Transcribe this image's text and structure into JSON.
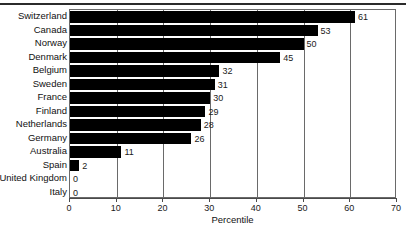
{
  "chart_data": {
    "type": "bar",
    "orientation": "horizontal",
    "title": "",
    "xlabel": "Percentile",
    "ylabel": "",
    "xlim": [
      0,
      70
    ],
    "xticks": [
      0,
      10,
      20,
      30,
      40,
      50,
      60,
      70
    ],
    "grid": true,
    "legend": null,
    "bar_color": "#000000",
    "frame_color": "#6a6a6a",
    "categories": [
      "Switzerland",
      "Canada",
      "Norway",
      "Denmark",
      "Belgium",
      "Sweden",
      "France",
      "Finland",
      "Netherlands",
      "Germany",
      "Australia",
      "United Kingdom",
      "Italy"
    ],
    "values": [
      61,
      53,
      50,
      45,
      32,
      31,
      30,
      29,
      28,
      26,
      11,
      2,
      0
    ],
    "data_labels": [
      "61",
      "53",
      "50",
      "45",
      "32",
      "31",
      "30",
      "29",
      "28",
      "26",
      "11",
      "2",
      "0"
    ],
    "extra_zero_row": {
      "category": "Italy",
      "value": 0,
      "label": "0"
    }
  },
  "axis": {
    "tick_labels": [
      "0",
      "10",
      "20",
      "30",
      "40",
      "50",
      "60",
      "70"
    ],
    "title": "Percentile"
  },
  "rows": [
    {
      "label": "Switzerland",
      "value": 61,
      "value_label": "61"
    },
    {
      "label": "Canada",
      "value": 53,
      "value_label": "53"
    },
    {
      "label": "Norway",
      "value": 50,
      "value_label": "50"
    },
    {
      "label": "Denmark",
      "value": 45,
      "value_label": "45"
    },
    {
      "label": "Belgium",
      "value": 32,
      "value_label": "32"
    },
    {
      "label": "Sweden",
      "value": 31,
      "value_label": "31"
    },
    {
      "label": "France",
      "value": 30,
      "value_label": "30"
    },
    {
      "label": "Finland",
      "value": 29,
      "value_label": "29"
    },
    {
      "label": "Netherlands",
      "value": 28,
      "value_label": "28"
    },
    {
      "label": "Germany",
      "value": 26,
      "value_label": "26"
    },
    {
      "label": "Australia",
      "value": 11,
      "value_label": "11"
    },
    {
      "label": "Spain",
      "value": 2,
      "value_label": "2"
    },
    {
      "label": "United Kingdom",
      "value": 0,
      "value_label": "0"
    },
    {
      "label": "Italy",
      "value": 0,
      "value_label": "0"
    }
  ]
}
